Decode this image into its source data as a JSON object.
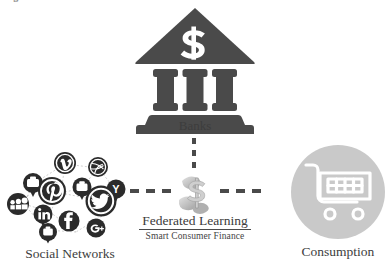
{
  "figure": {
    "title_sliver": "Fig. 1. Framework overview.",
    "background_color": "#ffffff",
    "dark_gray": "#4a4a4a",
    "light_gray": "#c9c9c9"
  },
  "nodes": {
    "banks": {
      "label": "Banks",
      "icon": "bank-icon",
      "icon_symbol": "$",
      "color": "#4a4a4a"
    },
    "social_networks": {
      "label": "Social Networks",
      "icon": "social-network-cluster-icon",
      "color": "#2d2d2d",
      "platforms": [
        "vimeo",
        "dribbble",
        "flickr",
        "pinterest-pin",
        "periscope",
        "yahoo",
        "myspace",
        "pinterest",
        "twitter",
        "linkedin",
        "facebook",
        "google-plus",
        "message"
      ]
    },
    "consumption": {
      "label": "Consumption",
      "icon": "shopping-cart-icon",
      "circle_color": "#c9c9c9",
      "cart_color": "#ffffff"
    },
    "federated_learning": {
      "title": "Federated Learning",
      "subtitle": "Smart Consumer Finance",
      "icon": "money-dollar-icon",
      "color": "#b3b3b3"
    }
  },
  "connectors": [
    {
      "name": "banks-to-federated-learning",
      "style": "dashed",
      "orientation": "vertical",
      "dashes": 4
    },
    {
      "name": "social-networks-to-federated-learning",
      "style": "dashed",
      "orientation": "horizontal",
      "dashes": 3
    },
    {
      "name": "federated-learning-to-consumption",
      "style": "dashed",
      "orientation": "horizontal",
      "dashes": 3
    }
  ]
}
